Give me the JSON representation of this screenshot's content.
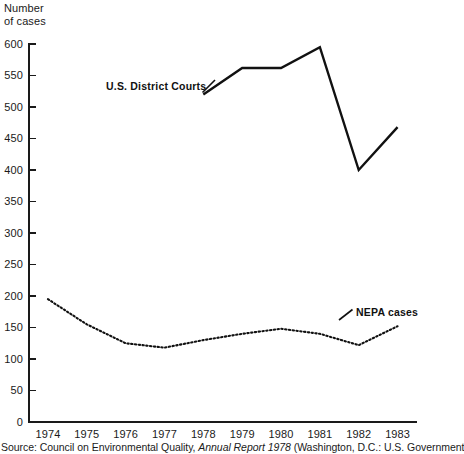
{
  "figure": {
    "y_axis_title": "Number\nof cases",
    "source_prefix": "Source: Council on Environmental Quality, ",
    "source_italic": "Annual Report 1978",
    "source_suffix": " (Washington, D.C.: U.S. Government",
    "series_label_district": "U.S. District Courts",
    "series_label_nepa": "NEPA cases",
    "line_color": "#111111",
    "axis_color": "#1a1a1a",
    "background": "#ffffff"
  },
  "chart_data": {
    "type": "line",
    "title": "",
    "xlabel": "",
    "ylabel": "Number of cases",
    "categories": [
      "1974",
      "1975",
      "1976",
      "1977",
      "1978",
      "1979",
      "1980",
      "1981",
      "1982",
      "1983"
    ],
    "x": [
      1974,
      1975,
      1976,
      1977,
      1978,
      1979,
      1980,
      1981,
      1982,
      1983
    ],
    "ylim": [
      0,
      600
    ],
    "xlim": [
      1973.5,
      1983.5
    ],
    "yticks": [
      0,
      50,
      100,
      150,
      200,
      250,
      300,
      350,
      400,
      450,
      500,
      550,
      600
    ],
    "ytick_labels": [
      "0",
      "50",
      "100",
      "150",
      "200",
      "250",
      "300",
      "350",
      "400",
      "450",
      "500",
      "550",
      "600"
    ],
    "xticks": [
      1974,
      1975,
      1976,
      1977,
      1978,
      1979,
      1980,
      1981,
      1982,
      1983
    ],
    "xtick_labels": [
      "1974",
      "1975",
      "1976",
      "1977",
      "1978",
      "1979",
      "1980",
      "1981",
      "1982",
      "1983"
    ],
    "grid": false,
    "legend": "inline-annotations",
    "series": [
      {
        "name": "U.S. District Courts",
        "style": "solid",
        "color": "#111111",
        "x": [
          1978,
          1979,
          1980,
          1981,
          1982,
          1983
        ],
        "values": [
          520,
          562,
          562,
          595,
          400,
          468
        ]
      },
      {
        "name": "NEPA cases",
        "style": "dotted",
        "color": "#111111",
        "x": [
          1974,
          1975,
          1976,
          1977,
          1978,
          1979,
          1980,
          1981,
          1982,
          1983
        ],
        "values": [
          195,
          155,
          125,
          118,
          130,
          140,
          148,
          140,
          122,
          152
        ]
      }
    ]
  }
}
